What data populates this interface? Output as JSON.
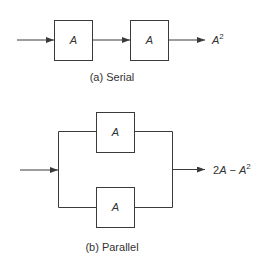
{
  "serial": {
    "caption": "(a) Serial",
    "blocks": [
      {
        "label": "A"
      },
      {
        "label": "A"
      }
    ],
    "output": {
      "base": "A",
      "sup": "2"
    }
  },
  "parallel": {
    "caption": "(b) Parallel",
    "blocks": [
      {
        "label": "A"
      },
      {
        "label": "A"
      }
    ],
    "output": {
      "prefix": "2",
      "var1": "A",
      "op": " − ",
      "base": "A",
      "sup": "2"
    }
  },
  "colors": {
    "stroke": "#3a3a3a",
    "text": "#333333",
    "background": "#ffffff"
  }
}
